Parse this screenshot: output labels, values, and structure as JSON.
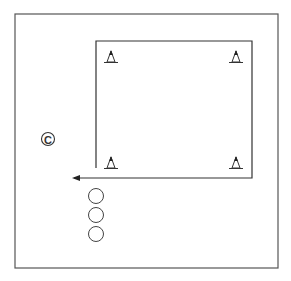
{
  "diagram": {
    "colors": {
      "stroke": "#333333",
      "background": "#ffffff"
    },
    "field": {
      "x": 15,
      "y": 14,
      "width": 263,
      "height": 254
    },
    "path": {
      "points": "96,168 96,41 252,41 252,178 74,178",
      "arrow_tip": [
        72,
        178
      ]
    },
    "cones": [
      {
        "x": 111,
        "y": 57
      },
      {
        "x": 236,
        "y": 57
      },
      {
        "x": 111,
        "y": 163
      },
      {
        "x": 236,
        "y": 163
      }
    ],
    "coach": {
      "x": 48,
      "y": 139,
      "label": "C"
    },
    "players": [
      {
        "x": 96,
        "y": 196
      },
      {
        "x": 96,
        "y": 215
      },
      {
        "x": 96,
        "y": 234
      }
    ]
  }
}
